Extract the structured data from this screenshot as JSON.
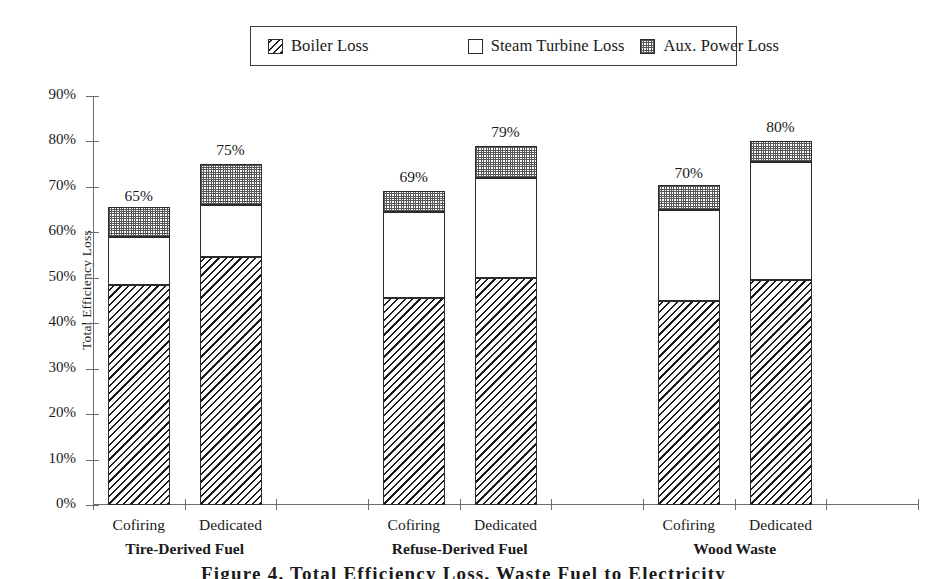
{
  "legend": {
    "items": [
      {
        "label": "Boiler Loss",
        "pattern": "hatch"
      },
      {
        "label": "Steam Turbine Loss",
        "pattern": "empty"
      },
      {
        "label": "Aux. Power Loss",
        "pattern": "dots"
      }
    ]
  },
  "caption": "Figure 4.  Total Efficiency Loss, Waste Fuel to Electricity",
  "chart_data": {
    "type": "bar",
    "stacked": true,
    "title": "",
    "xlabel": "",
    "ylabel": "Total Efficiency Loss",
    "ylim": [
      0,
      90
    ],
    "ytick_labels": [
      "0%",
      "10%",
      "20%",
      "30%",
      "40%",
      "50%",
      "60%",
      "70%",
      "80%",
      "90%"
    ],
    "ytick_values": [
      0,
      10,
      20,
      30,
      40,
      50,
      60,
      70,
      80,
      90
    ],
    "grid": false,
    "legend_position": "top",
    "categories": [
      "Cofiring",
      "Dedicated",
      "Cofiring",
      "Dedicated",
      "Cofiring",
      "Dedicated"
    ],
    "groups": [
      {
        "label": "Tire-Derived Fuel",
        "categories": [
          "Cofiring",
          "Dedicated"
        ]
      },
      {
        "label": "Refuse-Derived Fuel",
        "categories": [
          "Cofiring",
          "Dedicated"
        ]
      },
      {
        "label": "Wood Waste",
        "categories": [
          "Cofiring",
          "Dedicated"
        ]
      }
    ],
    "series": [
      {
        "name": "Boiler Loss",
        "pattern": "hatch",
        "values": [
          48.5,
          54.5,
          45.5,
          50.0,
          45.0,
          49.5
        ]
      },
      {
        "name": "Steam Turbine Loss",
        "pattern": "empty",
        "values": [
          10.5,
          11.5,
          19.0,
          22.0,
          20.0,
          26.0
        ]
      },
      {
        "name": "Aux. Power Loss",
        "pattern": "dots",
        "values": [
          6.5,
          9.0,
          4.5,
          7.0,
          5.5,
          4.5
        ]
      }
    ],
    "totals": [
      65,
      75,
      69,
      79,
      70,
      80
    ],
    "total_labels": [
      "65%",
      "75%",
      "69%",
      "79%",
      "70%",
      "80%"
    ],
    "bar_slots": [
      0,
      1,
      3,
      4,
      6,
      7
    ],
    "slot_count": 9
  }
}
